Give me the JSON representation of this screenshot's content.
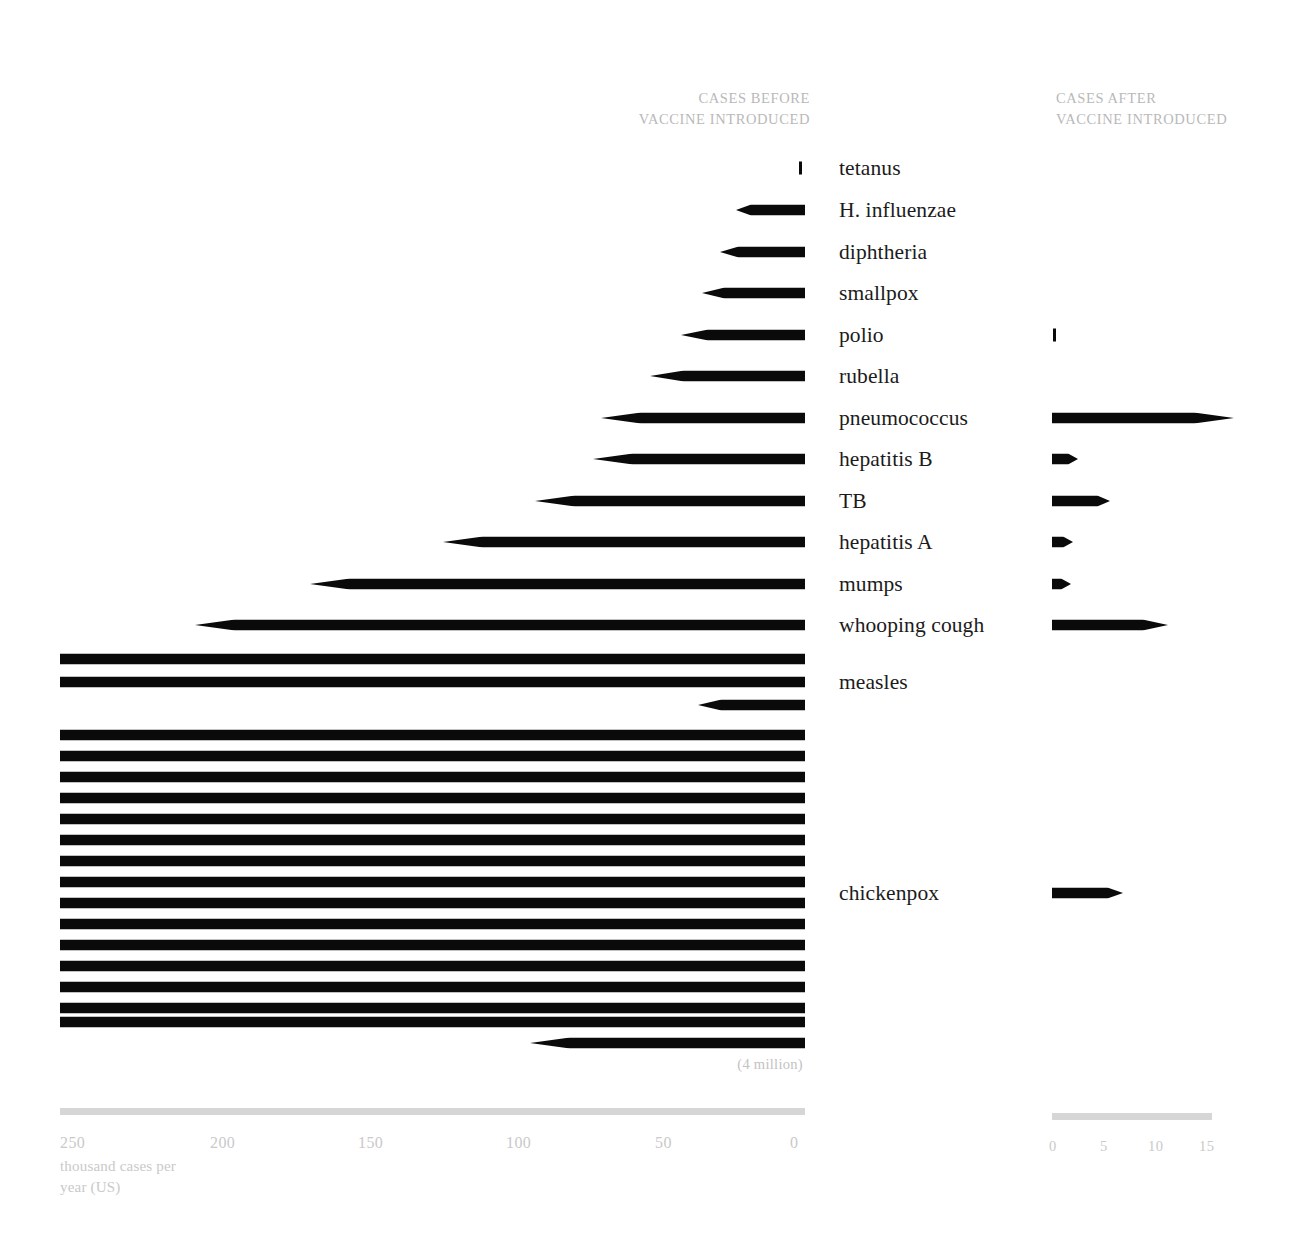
{
  "headers": {
    "before": "CASES BEFORE\nVACCINE INTRODUCED",
    "after": "CASES AFTER\nVACCINE INTRODUCED"
  },
  "annotation": {
    "four_million": "(4 million)"
  },
  "axis_left": {
    "caption": "thousand\ncases per\nyear (US)",
    "ticks": [
      "250",
      "200",
      "150",
      "100",
      "50",
      "0"
    ],
    "unit_hint": "250"
  },
  "axis_right": {
    "ticks": [
      "0",
      "5",
      "10",
      "15"
    ]
  },
  "colors": {
    "bar": "#0a0a0a",
    "axis_rule": "#d6d6d6",
    "axis_text": "#c9c9c9",
    "header_text": "#b9b9b9",
    "label_text": "#1b1b1b",
    "background": "#ffffff"
  },
  "chart_data": {
    "type": "bar",
    "title": "",
    "subtitle": "",
    "orientation": "horizontal-diverging",
    "xlabel": "thousand cases per year (US)",
    "ylabel": "",
    "grid": false,
    "legend": [
      "CASES BEFORE VACCINE INTRODUCED",
      "CASES AFTER VACCINE INTRODUCED"
    ],
    "legend_position": "top",
    "left_axis_range": [
      250,
      0
    ],
    "left_axis_ticks": [
      250,
      200,
      150,
      100,
      50,
      0
    ],
    "right_axis_range": [
      0,
      15
    ],
    "right_axis_ticks": [
      0,
      5,
      10,
      15
    ],
    "units": "thousand cases per year (US)",
    "categories": [
      "tetanus",
      "H. influenzae",
      "diphtheria",
      "smallpox",
      "polio",
      "rubella",
      "pneumococcus",
      "hepatitis B",
      "TB",
      "hepatitis A",
      "mumps",
      "whooping cough",
      "measles",
      "chickenpox"
    ],
    "series": [
      {
        "name": "CASES BEFORE VACCINE INTRODUCED",
        "units": "thousand cases per year (US)",
        "values": [
          0.6,
          20.0,
          26.5,
          32.0,
          38.5,
          48.0,
          64.0,
          66.5,
          88.0,
          117.0,
          159.0,
          199.0,
          530.0,
          4085.0
        ]
      },
      {
        "name": "CASES AFTER VACCINE INTRODUCED",
        "units": "thousand cases per year (US)",
        "values": [
          0.0,
          0.0,
          0.0,
          0.0,
          0.05,
          0.0,
          15.8,
          2.2,
          5.2,
          1.9,
          1.7,
          10.0,
          0.0,
          6.5
        ]
      }
    ],
    "rows": [
      {
        "label": "tetanus",
        "before": 0.6,
        "after": 0.0,
        "before_kind": "tick",
        "after_kind": "none"
      },
      {
        "label": "H. influenzae",
        "before": 20.0,
        "after": 0.0,
        "before_kind": "arrow",
        "after_kind": "none"
      },
      {
        "label": "diphtheria",
        "before": 26.5,
        "after": 0.0,
        "before_kind": "arrow",
        "after_kind": "none"
      },
      {
        "label": "smallpox",
        "before": 32.0,
        "after": 0.0,
        "before_kind": "arrow",
        "after_kind": "none"
      },
      {
        "label": "polio",
        "before": 38.5,
        "after": 0.05,
        "before_kind": "arrow",
        "after_kind": "tick"
      },
      {
        "label": "rubella",
        "before": 48.0,
        "after": 0.0,
        "before_kind": "arrow",
        "after_kind": "none"
      },
      {
        "label": "pneumococcus",
        "before": 64.0,
        "after": 15.8,
        "before_kind": "arrow",
        "after_kind": "arrow"
      },
      {
        "label": "hepatitis B",
        "before": 66.5,
        "after": 2.2,
        "before_kind": "arrow",
        "after_kind": "arrow"
      },
      {
        "label": "TB",
        "before": 88.0,
        "after": 5.2,
        "before_kind": "arrow",
        "after_kind": "arrow"
      },
      {
        "label": "hepatitis A",
        "before": 117.0,
        "after": 1.9,
        "before_kind": "arrow",
        "after_kind": "arrow"
      },
      {
        "label": "mumps",
        "before": 159.0,
        "after": 1.7,
        "before_kind": "arrow",
        "after_kind": "arrow"
      },
      {
        "label": "whooping cough",
        "before": 199.0,
        "after": 10.0,
        "before_kind": "arrow",
        "after_kind": "arrow"
      },
      {
        "label": "measles",
        "before": 530.0,
        "after": 0.0,
        "before_kind": "wrapped",
        "after_kind": "none",
        "wrap_full_rows": 2,
        "wrap_last_value": 30.0
      },
      {
        "label": "chickenpox",
        "before": 4085.0,
        "after": 6.5,
        "before_kind": "wrapped",
        "after_kind": "arrow",
        "wrap_full_rows": 15,
        "wrap_last_value": 85.0,
        "note": "(4 million)"
      }
    ]
  },
  "bar_geometry": {
    "left_axis_x_zero": 805,
    "left_axis_x_max": 60,
    "right_axis_x_zero": 1052,
    "right_axis_x_max": 1212,
    "bar_thickness": 11
  },
  "bar_rows_px": [
    {
      "name": "tetanus",
      "y": 168,
      "left": {
        "kind": "tick",
        "x1": 799,
        "x2": 805
      },
      "right": {
        "kind": "none"
      }
    },
    {
      "name": "H. influenzae",
      "y": 210,
      "left": {
        "kind": "arrow",
        "x1": 736,
        "x2": 805
      },
      "right": {
        "kind": "none"
      }
    },
    {
      "name": "diphtheria",
      "y": 252,
      "left": {
        "kind": "arrow",
        "x1": 720,
        "x2": 805
      },
      "right": {
        "kind": "none"
      }
    },
    {
      "name": "smallpox",
      "y": 293,
      "left": {
        "kind": "arrow",
        "x1": 702,
        "x2": 805
      },
      "right": {
        "kind": "none"
      }
    },
    {
      "name": "polio",
      "y": 335,
      "left": {
        "kind": "arrow",
        "x1": 681,
        "x2": 805
      },
      "right": {
        "kind": "tick",
        "x1": 1053,
        "x2": 1058
      }
    },
    {
      "name": "rubella",
      "y": 376,
      "left": {
        "kind": "arrow",
        "x1": 650,
        "x2": 805
      },
      "right": {
        "kind": "none"
      }
    },
    {
      "name": "pneumococcus",
      "y": 418,
      "left": {
        "kind": "arrow",
        "x1": 601,
        "x2": 805
      },
      "right": {
        "kind": "arrow",
        "x1": 1052,
        "x2": 1234
      }
    },
    {
      "name": "hepatitis B",
      "y": 459,
      "left": {
        "kind": "arrow",
        "x1": 593,
        "x2": 805
      },
      "right": {
        "kind": "arrow",
        "x1": 1052,
        "x2": 1078
      }
    },
    {
      "name": "TB",
      "y": 501,
      "left": {
        "kind": "arrow",
        "x1": 535,
        "x2": 805
      },
      "right": {
        "kind": "arrow",
        "x1": 1052,
        "x2": 1110
      }
    },
    {
      "name": "hepatitis A",
      "y": 542,
      "left": {
        "kind": "arrow",
        "x1": 443,
        "x2": 805
      },
      "right": {
        "kind": "arrow",
        "x1": 1052,
        "x2": 1073
      }
    },
    {
      "name": "mumps",
      "y": 584,
      "left": {
        "kind": "arrow",
        "x1": 310,
        "x2": 805
      },
      "right": {
        "kind": "arrow",
        "x1": 1052,
        "x2": 1071
      }
    },
    {
      "name": "whooping cough",
      "y": 625,
      "left": {
        "kind": "arrow",
        "x1": 195,
        "x2": 805
      },
      "right": {
        "kind": "arrow",
        "x1": 1052,
        "x2": 1168
      }
    },
    {
      "name": "chickenpox",
      "y": 893,
      "left": {
        "kind": "none"
      },
      "right": {
        "kind": "arrow",
        "x1": 1052,
        "x2": 1123
      }
    }
  ],
  "wrapped_rows_px": {
    "measles": {
      "label_y": 682,
      "full": [
        {
          "y": 659,
          "x1": 60,
          "x2": 805
        },
        {
          "y": 682,
          "x1": 60,
          "x2": 805
        }
      ],
      "last": {
        "y": 705,
        "x1": 698,
        "x2": 805
      }
    },
    "chickenpox": {
      "label_y": 893,
      "full": [
        {
          "y": 735,
          "x1": 60,
          "x2": 805
        },
        {
          "y": 756,
          "x1": 60,
          "x2": 805
        },
        {
          "y": 777,
          "x1": 60,
          "x2": 805
        },
        {
          "y": 798,
          "x1": 60,
          "x2": 805
        },
        {
          "y": 819,
          "x1": 60,
          "x2": 805
        },
        {
          "y": 840,
          "x1": 60,
          "x2": 805
        },
        {
          "y": 861,
          "x1": 60,
          "x2": 805
        },
        {
          "y": 882,
          "x1": 60,
          "x2": 805
        },
        {
          "y": 903,
          "x1": 60,
          "x2": 805
        },
        {
          "y": 924,
          "x1": 60,
          "x2": 805
        },
        {
          "y": 945,
          "x1": 60,
          "x2": 805
        },
        {
          "y": 966,
          "x1": 60,
          "x2": 805
        },
        {
          "y": 987,
          "x1": 60,
          "x2": 805
        },
        {
          "y": 1008,
          "x1": 60,
          "x2": 805
        },
        {
          "y": 1022,
          "x1": 60,
          "x2": 805
        }
      ],
      "last": {
        "y": 1043,
        "x1": 530,
        "x2": 805
      }
    }
  },
  "label_rows_px": [
    {
      "label": "tetanus",
      "y": 168
    },
    {
      "label": "H. influenzae",
      "y": 210
    },
    {
      "label": "diphtheria",
      "y": 252
    },
    {
      "label": "smallpox",
      "y": 293
    },
    {
      "label": "polio",
      "y": 335
    },
    {
      "label": "rubella",
      "y": 376
    },
    {
      "label": "pneumococcus",
      "y": 418
    },
    {
      "label": "hepatitis B",
      "y": 459
    },
    {
      "label": "TB",
      "y": 501
    },
    {
      "label": "hepatitis A",
      "y": 542
    },
    {
      "label": "mumps",
      "y": 584
    },
    {
      "label": "whooping cough",
      "y": 625
    },
    {
      "label": "measles",
      "y": 682
    },
    {
      "label": "chickenpox",
      "y": 893
    }
  ],
  "axis_tick_px": {
    "left": [
      {
        "t": "250",
        "x": 60
      },
      {
        "t": "200",
        "x": 210
      },
      {
        "t": "150",
        "x": 358
      },
      {
        "t": "100",
        "x": 506
      },
      {
        "t": "50",
        "x": 655
      },
      {
        "t": "0",
        "x": 790
      }
    ],
    "right": [
      {
        "t": "0",
        "x": 1049
      },
      {
        "t": "5",
        "x": 1100
      },
      {
        "t": "10",
        "x": 1148
      },
      {
        "t": "15",
        "x": 1199
      }
    ]
  }
}
